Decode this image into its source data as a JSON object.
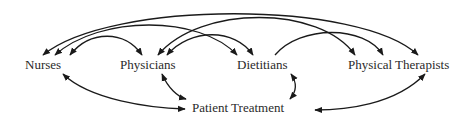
{
  "diagram": {
    "nodes": [
      {
        "id": "nurses",
        "label": "Nurses"
      },
      {
        "id": "physicians",
        "label": "Physicians"
      },
      {
        "id": "dietitians",
        "label": "Dietitians"
      },
      {
        "id": "physical_therapists",
        "label": "Physical Therapists"
      },
      {
        "id": "patient_treatment",
        "label": "Patient Treatment"
      }
    ],
    "edges": [
      {
        "from": "nurses",
        "to": "physical_therapists",
        "bidirectional": true
      },
      {
        "from": "nurses",
        "to": "dietitians",
        "bidirectional": true
      },
      {
        "from": "nurses",
        "to": "physicians",
        "bidirectional": true
      },
      {
        "from": "physicians",
        "to": "physical_therapists",
        "bidirectional": true
      },
      {
        "from": "physicians",
        "to": "dietitians",
        "bidirectional": true
      },
      {
        "from": "dietitians",
        "to": "physical_therapists",
        "bidirectional": true
      },
      {
        "from": "nurses",
        "to": "patient_treatment",
        "bidirectional": true
      },
      {
        "from": "physicians",
        "to": "patient_treatment",
        "bidirectional": true
      },
      {
        "from": "dietitians",
        "to": "patient_treatment",
        "bidirectional": true
      },
      {
        "from": "physical_therapists",
        "to": "patient_treatment",
        "bidirectional": true
      }
    ],
    "colors": {
      "line": "#1a1a1a",
      "text": "#2a2a2a",
      "background": "#ffffff"
    }
  }
}
